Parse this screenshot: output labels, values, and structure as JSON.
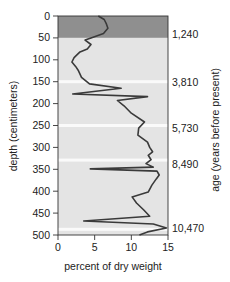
{
  "chart_data": {
    "type": "line",
    "orientation": "vertical-profile",
    "title": "",
    "xlabel": "percent of dry weight",
    "ylabel": "depth (centimeters)",
    "y2label": "age (years before present)",
    "xlim": [
      0,
      15
    ],
    "ylim": [
      0,
      500
    ],
    "y_inverted": true,
    "x_ticks": [
      0,
      5,
      10,
      15
    ],
    "y_ticks": [
      0,
      50,
      100,
      150,
      200,
      250,
      300,
      350,
      400,
      450,
      500
    ],
    "age_labels": [
      {
        "depth": 40,
        "label": "1,240"
      },
      {
        "depth": 150,
        "label": "3,810"
      },
      {
        "depth": 255,
        "label": "5,730"
      },
      {
        "depth": 337,
        "label": "8,490"
      },
      {
        "depth": 485,
        "label": "10,470"
      }
    ],
    "bands": [
      {
        "from": 0,
        "to": 50,
        "color": "#8f8f8f"
      },
      {
        "from": 50,
        "to": 500,
        "color": "#e4e4e4"
      }
    ],
    "white_lines": [
      150,
      250,
      329,
      487
    ],
    "series": [
      {
        "name": "percent of dry weight",
        "points": [
          [
            5.5,
            0
          ],
          [
            6.3,
            8
          ],
          [
            6.6,
            18
          ],
          [
            6.8,
            28
          ],
          [
            6.2,
            40
          ],
          [
            4.5,
            50
          ],
          [
            3.7,
            55
          ],
          [
            4.5,
            65
          ],
          [
            4.0,
            75
          ],
          [
            3.0,
            82
          ],
          [
            2.2,
            95
          ],
          [
            1.9,
            105
          ],
          [
            2.4,
            115
          ],
          [
            2.8,
            125
          ],
          [
            3.2,
            140
          ],
          [
            4.3,
            155
          ],
          [
            8.6,
            165
          ],
          [
            2.0,
            178
          ],
          [
            12.2,
            184
          ],
          [
            8.1,
            193
          ],
          [
            9.0,
            205
          ],
          [
            10.0,
            222
          ],
          [
            11.8,
            242
          ],
          [
            11.0,
            256
          ],
          [
            10.9,
            272
          ],
          [
            12.2,
            288
          ],
          [
            12.5,
            300
          ],
          [
            12.9,
            310
          ],
          [
            12.3,
            318
          ],
          [
            12.7,
            328
          ],
          [
            12.0,
            337
          ],
          [
            13.0,
            345
          ],
          [
            4.4,
            349
          ],
          [
            13.5,
            354
          ],
          [
            13.8,
            363
          ],
          [
            13.4,
            372
          ],
          [
            12.8,
            386
          ],
          [
            12.3,
            402
          ],
          [
            10.1,
            413
          ],
          [
            10.7,
            427
          ],
          [
            11.7,
            443
          ],
          [
            12.5,
            457
          ],
          [
            3.5,
            468
          ],
          [
            13.0,
            475
          ],
          [
            14.8,
            484
          ],
          [
            12.2,
            493
          ],
          [
            11.1,
            500
          ]
        ]
      }
    ]
  }
}
